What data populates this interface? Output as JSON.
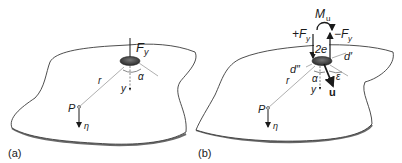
{
  "figure": {
    "panels": [
      {
        "id": "a",
        "caption": "(a)",
        "labels": {
          "force": "F",
          "force_sub": "y",
          "angle": "α",
          "radius": "r",
          "axis": "y",
          "point": "P",
          "displacement": "η"
        }
      },
      {
        "id": "b",
        "caption": "(b)",
        "labels": {
          "moment": "M",
          "moment_sub": "u",
          "force_pos": "+F",
          "force_pos_sub": "y",
          "force_neg": "−F",
          "force_neg_sub": "y",
          "offset": "2e",
          "d_prime": "d′",
          "d_double_prime": "d″",
          "angle": "α",
          "epsilon": "ε",
          "radius": "r",
          "axis": "y",
          "direction": "u",
          "point": "P",
          "displacement": "η"
        }
      }
    ],
    "colors": {
      "outline": "#3a3a3a",
      "construction_line": "#9a9a9a",
      "plate_edge": "#7a7a7a",
      "load_dark": "#2a2a2a"
    }
  }
}
